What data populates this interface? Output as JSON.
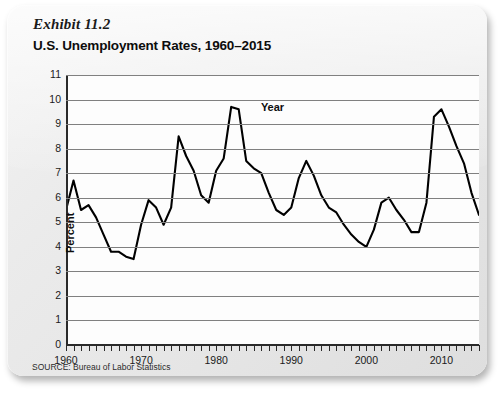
{
  "exhibit": {
    "label": "Exhibit 11.2"
  },
  "title": {
    "text": "U.S. Unemployment Rates, 1960–2015"
  },
  "source": {
    "text": "SOURCE: Bureau of Labor Statistics"
  },
  "colors": {
    "line": "#000000",
    "grid": "#808080",
    "axis": "#2a2a2a",
    "card": "#ebebeb",
    "plot_bg": "#fdfdfd"
  },
  "chart_data": {
    "type": "line",
    "title": "U.S. Unemployment Rates, 1960–2015",
    "xlabel": "Year",
    "ylabel": "Percent",
    "xlim": [
      1960,
      2015
    ],
    "ylim": [
      0,
      11
    ],
    "ytick_labels": [
      "0",
      "1",
      "2",
      "3",
      "4",
      "5",
      "6",
      "7",
      "8",
      "9",
      "10",
      "11"
    ],
    "ytick_values": [
      0,
      1,
      2,
      3,
      4,
      5,
      6,
      7,
      8,
      9,
      10,
      11
    ],
    "xtick_labels": [
      "1960",
      "1970",
      "1980",
      "1990",
      "2000",
      "2010"
    ],
    "xtick_values": [
      1960,
      1970,
      1980,
      1990,
      2000,
      2010
    ],
    "minor_xticks_every": 1,
    "grid": "horizontal",
    "legend": "none",
    "x": [
      1960,
      1961,
      1962,
      1963,
      1964,
      1965,
      1966,
      1967,
      1968,
      1969,
      1970,
      1971,
      1972,
      1973,
      1974,
      1975,
      1976,
      1977,
      1978,
      1979,
      1980,
      1981,
      1982,
      1983,
      1984,
      1985,
      1986,
      1987,
      1988,
      1989,
      1990,
      1991,
      1992,
      1993,
      1994,
      1995,
      1996,
      1997,
      1998,
      1999,
      2000,
      2001,
      2002,
      2003,
      2004,
      2005,
      2006,
      2007,
      2008,
      2009,
      2010,
      2011,
      2012,
      2013,
      2014,
      2015
    ],
    "values": [
      5.5,
      6.7,
      5.5,
      5.7,
      5.2,
      4.5,
      3.8,
      3.8,
      3.6,
      3.5,
      4.9,
      5.9,
      5.6,
      4.9,
      5.6,
      8.5,
      7.7,
      7.1,
      6.1,
      5.8,
      7.1,
      7.6,
      9.7,
      9.6,
      7.5,
      7.2,
      7.0,
      6.2,
      5.5,
      5.3,
      5.6,
      6.8,
      7.5,
      6.9,
      6.1,
      5.6,
      5.4,
      4.9,
      4.5,
      4.2,
      4.0,
      4.7,
      5.8,
      6.0,
      5.5,
      5.1,
      4.6,
      4.6,
      5.8,
      9.3,
      9.6,
      8.9,
      8.1,
      7.4,
      6.2,
      5.3
    ],
    "series_name": "U.S. Unemployment Rate"
  }
}
